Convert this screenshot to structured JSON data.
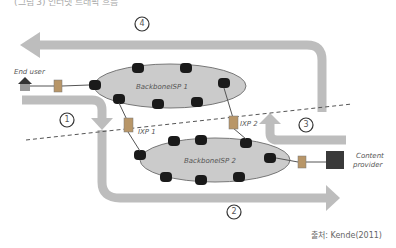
{
  "top_caption": "(그림 3) 인터넷 트래픽 흐름",
  "nodes": {
    "end_user": "End user",
    "backbone1": "BackboneISP 1",
    "backbone2": "BackboneISP 2",
    "ixp1": "IXP 1",
    "ixp2": "IXP 2",
    "content_provider_line1": "Content",
    "content_provider_line2": "provider"
  },
  "flows": [
    {
      "id": "1",
      "label": "1"
    },
    {
      "id": "2",
      "label": "2"
    },
    {
      "id": "3",
      "label": "3"
    },
    {
      "id": "4",
      "label": "4"
    }
  ],
  "source": "출처: Kende(2011)",
  "colors": {
    "arrow": "#b8b8b8",
    "ellipse_fill": "#c4c4c4",
    "node": "#1a1a1a",
    "dash": "#555555"
  }
}
